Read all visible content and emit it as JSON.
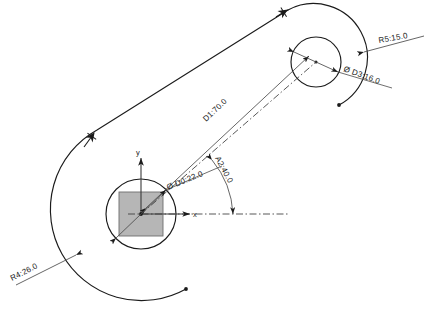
{
  "drawing": {
    "title": "Parametric crank link sketch",
    "background_color": "#ffffff",
    "line_color": "#1b1b1b",
    "dim_color": "#4a4a4a",
    "hub_fill_color": "#a9a9a9",
    "axis_label_x": "x",
    "axis_label_y": "y"
  },
  "dimensions": [
    {
      "id": "d0",
      "label": "Ø D0:22.0",
      "kind": "diameter",
      "name": "D0",
      "value": 22.0,
      "target": "center-hub-circle"
    },
    {
      "id": "d1",
      "label": "D1:70.0",
      "kind": "length",
      "name": "D1",
      "value": 70.0,
      "target": "center-distance"
    },
    {
      "id": "a2",
      "label": "A2:40.0",
      "kind": "angle",
      "name": "A2",
      "value": 40.0,
      "target": "arm-angle-from-x-axis"
    },
    {
      "id": "d3",
      "label": "Ø D3:16.0",
      "kind": "diameter",
      "name": "D3",
      "value": 16.0,
      "target": "pin-boss-circle"
    },
    {
      "id": "r4",
      "label": "R4:26.0",
      "kind": "radius",
      "name": "R4",
      "value": 26.0,
      "target": "left-outer-arc"
    },
    {
      "id": "r5",
      "label": "R5:15.0",
      "kind": "radius",
      "name": "R5",
      "value": 15.0,
      "target": "right-outer-arc"
    }
  ],
  "geometry": {
    "center_hub": {
      "cx": 141,
      "cy": 214,
      "r": 35,
      "square_half": 22
    },
    "pin_boss": {
      "cx": 316,
      "cy": 62,
      "r": 25
    },
    "outer_left_arc_r": 87,
    "outer_right_arc_r": 49
  }
}
